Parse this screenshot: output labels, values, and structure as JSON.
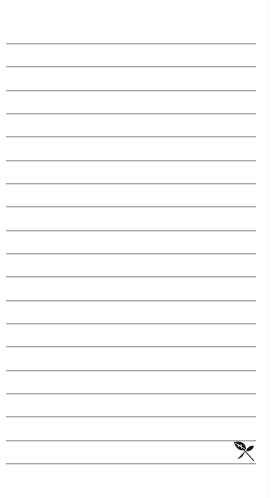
{
  "page": {
    "type": "lined-notepad",
    "background_color": "#ffffff",
    "rule_color": "#a9a9a9",
    "rule_count": 19,
    "rule_positions_y": [
      43,
      66,
      90,
      113,
      136,
      160,
      183,
      206,
      230,
      253,
      276,
      300,
      323,
      346,
      370,
      393,
      416,
      440,
      463
    ]
  },
  "decoration": {
    "icon": "leaf-sprig-icon",
    "color": "#1a1a1a"
  }
}
